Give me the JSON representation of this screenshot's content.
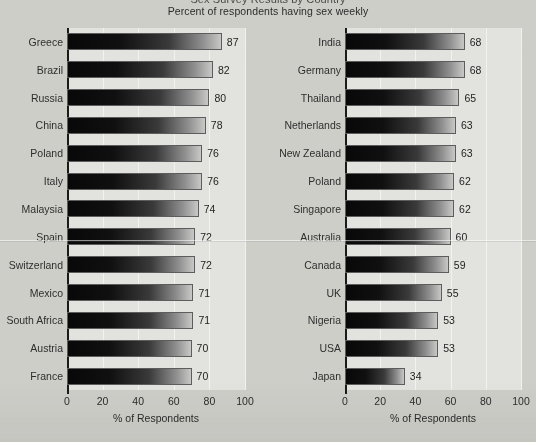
{
  "header": {
    "title_clipped": "Sex Survey Results by Country",
    "subtitle": "Percent of respondents having sex weekly"
  },
  "axis": {
    "ticks": [
      "0",
      "20",
      "40",
      "60",
      "80",
      "100"
    ],
    "tick_values": [
      0,
      20,
      40,
      60,
      80,
      100
    ],
    "xlabel": "% of Respondents"
  },
  "chart_data": {
    "type": "bar",
    "orientation": "horizontal",
    "title": "Sex Survey Results by Country",
    "subtitle": "Percent of respondents having sex weekly",
    "xlabel": "% of Respondents",
    "ylabel": "",
    "xlim": [
      0,
      100
    ],
    "xticks": [
      0,
      20,
      40,
      60,
      80,
      100
    ],
    "grid": true,
    "legend": "none",
    "panels": [
      {
        "name": "left-panel",
        "categories": [
          "Greece",
          "Brazil",
          "Russia",
          "China",
          "Poland",
          "Italy",
          "Malaysia",
          "Spain",
          "Switzerland",
          "Mexico",
          "South Africa",
          "Austria",
          "France"
        ],
        "values": [
          87,
          82,
          80,
          78,
          76,
          76,
          74,
          72,
          72,
          71,
          71,
          70,
          70
        ]
      },
      {
        "name": "right-panel",
        "categories": [
          "India",
          "Germany",
          "Thailand",
          "Netherlands",
          "New Zealand",
          "Poland",
          "Singapore",
          "Australia",
          "Canada",
          "UK",
          "Nigeria",
          "USA",
          "Japan"
        ],
        "values": [
          68,
          68,
          65,
          63,
          63,
          62,
          62,
          60,
          59,
          55,
          53,
          53,
          34
        ]
      }
    ]
  },
  "colors": {
    "page_background": "#cecec9",
    "plot_background": "#e2e2de",
    "gridline": "#f2f2ef",
    "axis": "#1a1a1a",
    "bar_dark": "#080808",
    "bar_light": "#c8c8c6",
    "bar_border": "#5d5d5d",
    "text": "#2b2b2b"
  }
}
